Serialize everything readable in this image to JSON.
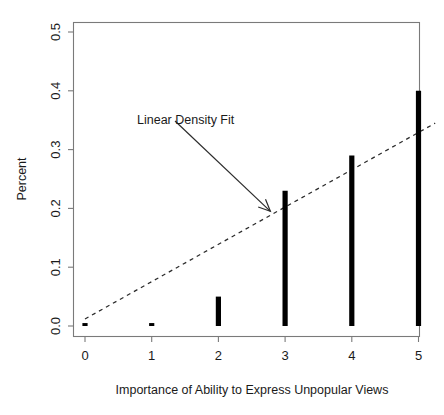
{
  "chart_data": {
    "type": "bar",
    "title": "",
    "subtitle": "",
    "xlabel": "Importance of Ability to Express Unpopular Views",
    "ylabel": "Percent",
    "categories": [
      "0",
      "1",
      "2",
      "3",
      "4",
      "5"
    ],
    "x": [
      0,
      1,
      2,
      3,
      4,
      5
    ],
    "values": [
      0.005,
      0.005,
      0.05,
      0.23,
      0.29,
      0.4
    ],
    "xlim": [
      -0.35,
      5.35
    ],
    "ylim": [
      0.0,
      0.52
    ],
    "xticks": [
      "0",
      "1",
      "2",
      "3",
      "4",
      "5"
    ],
    "yticks": [
      "0.0",
      "0.1",
      "0.2",
      "0.3",
      "0.4",
      "0.5"
    ],
    "ytick_values": [
      0.0,
      0.1,
      0.2,
      0.3,
      0.4,
      0.5
    ],
    "grid": false,
    "legend": false,
    "style": "needle-spikes",
    "bar_color": "#000000",
    "series": [
      {
        "name": "Percent",
        "values": [
          0.005,
          0.005,
          0.05,
          0.23,
          0.29,
          0.4
        ]
      }
    ],
    "fit": {
      "label": "Linear Density Fit",
      "type": "line",
      "linestyle": "dashed",
      "color": "#2b2b2b",
      "x_start": 0.0,
      "y_start": 0.012,
      "x_end": 5.25,
      "y_end": 0.345
    },
    "annotations": [
      {
        "text": "Linear Density Fit",
        "x": 1.05,
        "y": 0.335,
        "arrow_to_x": 2.78,
        "arrow_to_y": 0.195
      }
    ]
  },
  "labels": {
    "y_axis_title": "Percent",
    "x_axis_title": "Importance of Ability to Express Unpopular Views",
    "annotation": "Linear Density Fit",
    "y_ticks": {
      "t0": "0.0",
      "t1": "0.1",
      "t2": "0.2",
      "t3": "0.3",
      "t4": "0.4",
      "t5": "0.5"
    },
    "x_ticks": {
      "t0": "0",
      "t1": "1",
      "t2": "2",
      "t3": "3",
      "t4": "4",
      "t5": "5"
    }
  }
}
